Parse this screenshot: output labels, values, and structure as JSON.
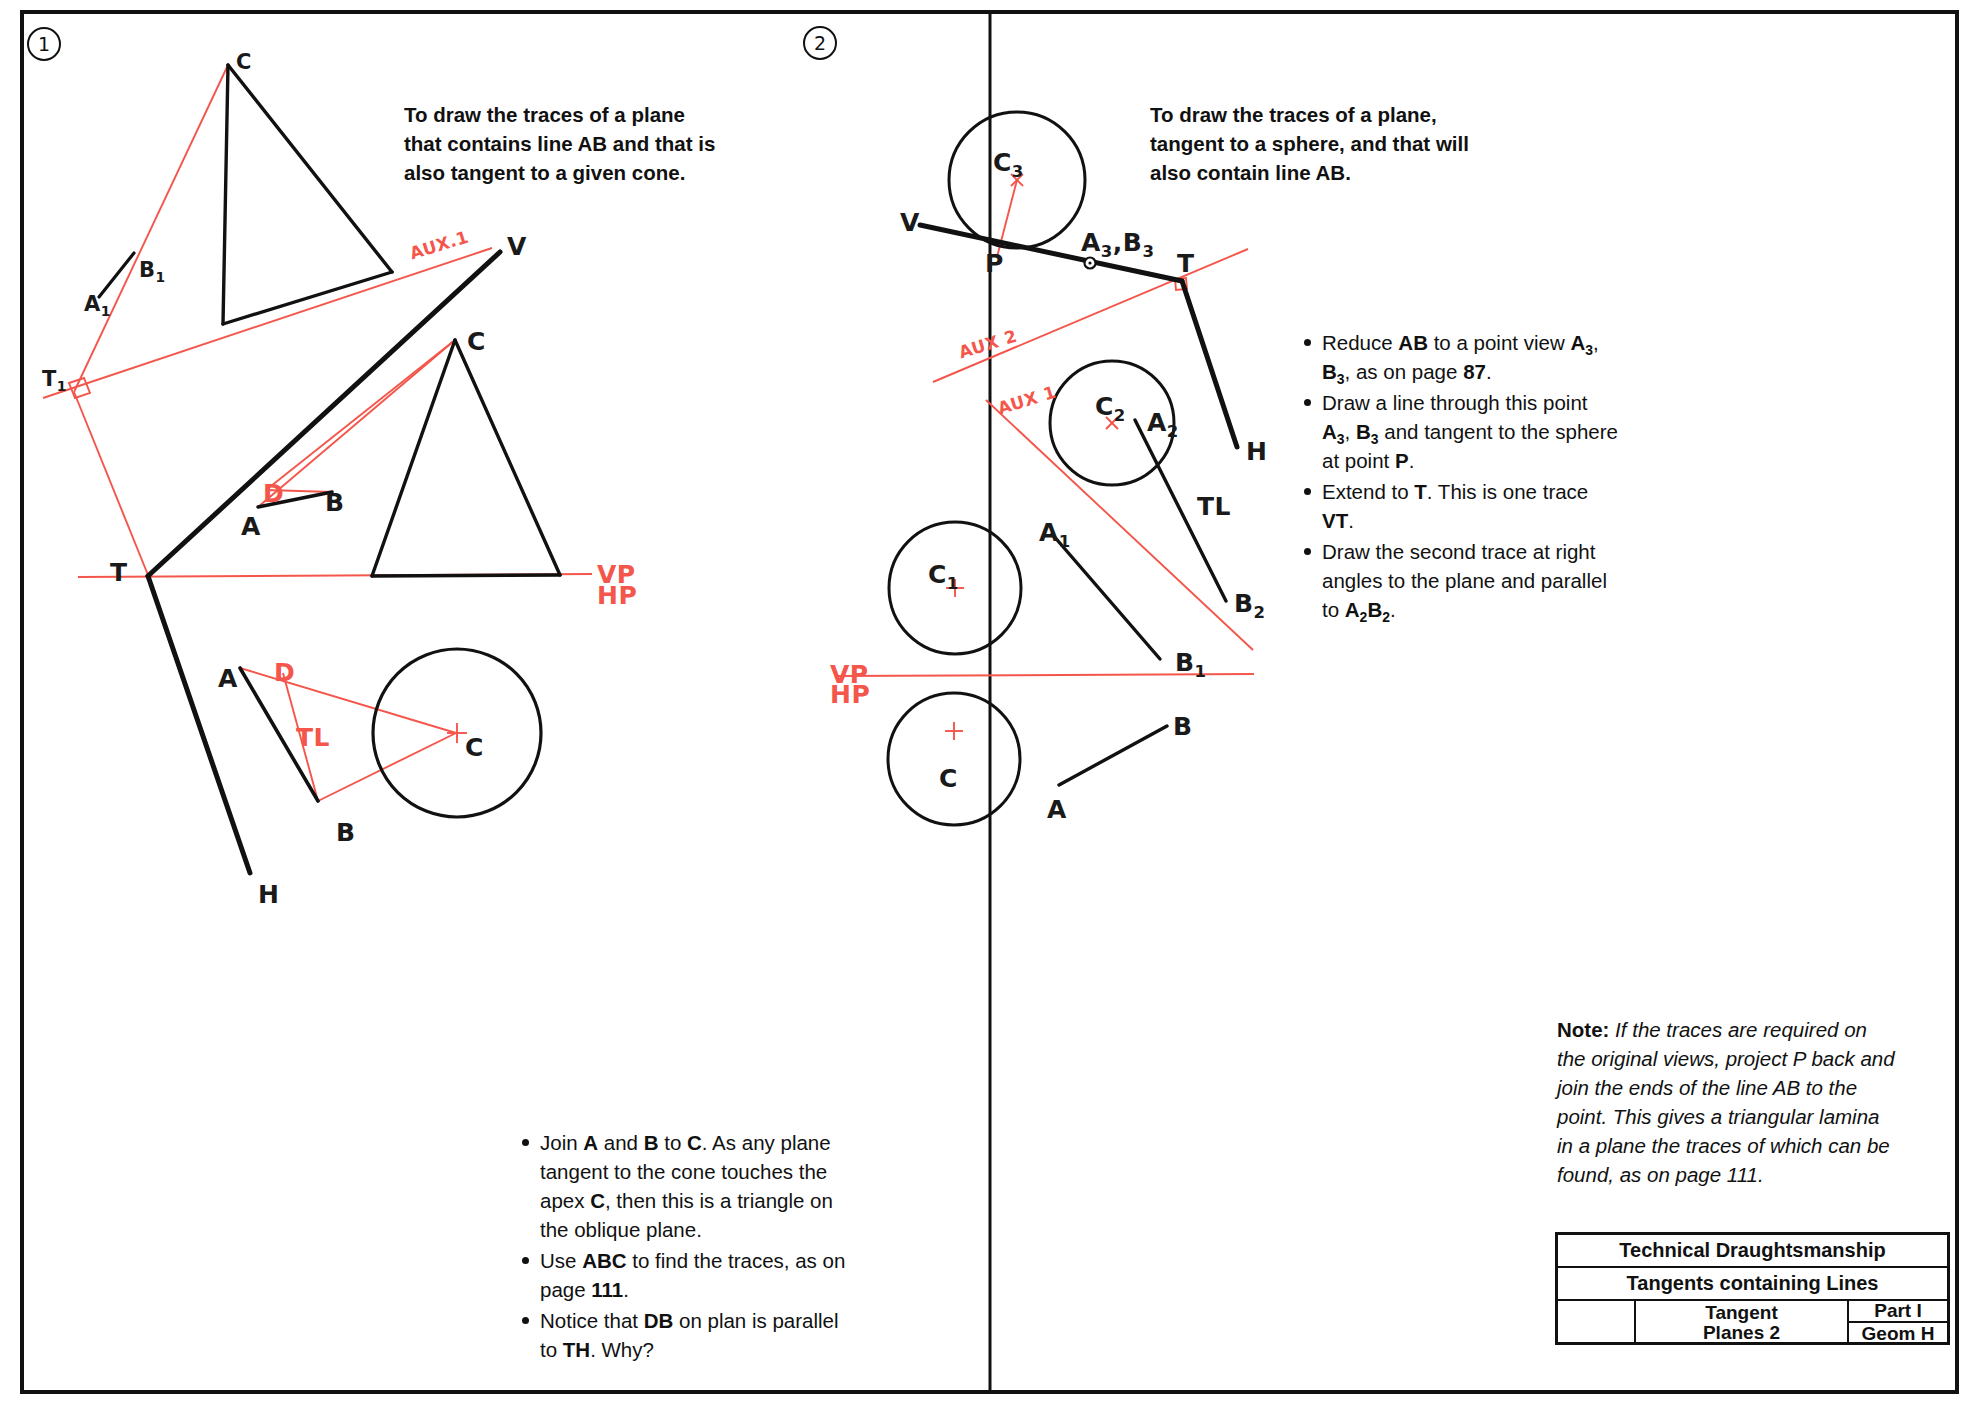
{
  "sheet": {
    "panels": [
      {
        "number": "1",
        "heading": "To draw the traces of a plane that contains line AB and that is also tangent to a given cone.",
        "bullets": [
          "Join <b>A</b> and <b>B</b> to <b>C</b>. As any plane tangent to the cone touches the apex <b>C</b>, then this is a triangle on the oblique plane.",
          "Use <b>ABC</b> to find the traces, as on page <b>111</b>.",
          "Notice that <b>DB</b> on plan is parallel to <b>TH</b>. Why?"
        ],
        "labels": [
          {
            "name": "apex-c-aux",
            "text": "C",
            "x": 236,
            "y": 50,
            "red": false,
            "size": "sm"
          },
          {
            "name": "point-b1",
            "text": "B<sub>1</sub>",
            "x": 139,
            "y": 258,
            "red": false,
            "size": "sm"
          },
          {
            "name": "point-a1",
            "text": "A<sub>1</sub>",
            "x": 84,
            "y": 292,
            "red": false,
            "size": "sm"
          },
          {
            "name": "trace-t1",
            "text": "T<sub>1</sub>",
            "x": 42,
            "y": 367,
            "red": false,
            "size": "sm"
          },
          {
            "name": "aux1-line-label",
            "text": "AUX.1",
            "x": 409,
            "y": 235,
            "red": true
          },
          {
            "name": "vertical-trace-v",
            "text": "V",
            "x": 507,
            "y": 232,
            "red": false
          },
          {
            "name": "apex-c-elevation",
            "text": "C",
            "x": 467,
            "y": 327,
            "red": false
          },
          {
            "name": "point-d-elevation",
            "text": "D",
            "x": 263,
            "y": 479,
            "red": true
          },
          {
            "name": "point-b-elevation",
            "text": "B",
            "x": 325,
            "y": 488,
            "red": false
          },
          {
            "name": "point-a-elevation",
            "text": "A",
            "x": 241,
            "y": 512,
            "red": false
          },
          {
            "name": "trace-t",
            "text": "T",
            "x": 110,
            "y": 558,
            "red": false
          },
          {
            "name": "vp-label",
            "text": "VP",
            "x": 597,
            "y": 560,
            "red": true
          },
          {
            "name": "hp-label",
            "text": "HP",
            "x": 597,
            "y": 581,
            "red": true
          },
          {
            "name": "point-a-plan",
            "text": "A",
            "x": 218,
            "y": 664,
            "red": false
          },
          {
            "name": "point-d-plan",
            "text": "D",
            "x": 274,
            "y": 658,
            "red": true
          },
          {
            "name": "tl-label-plan",
            "text": "TL",
            "x": 296,
            "y": 723,
            "red": true
          },
          {
            "name": "centre-c-plan",
            "text": "C",
            "x": 465,
            "y": 733,
            "red": false
          },
          {
            "name": "point-b-plan",
            "text": "B",
            "x": 336,
            "y": 818,
            "red": false
          },
          {
            "name": "horizontal-trace-h",
            "text": "H",
            "x": 258,
            "y": 880,
            "red": false
          }
        ]
      },
      {
        "number": "2",
        "heading": "To draw the traces of a plane, tangent to a sphere, and that will also contain line AB.",
        "bullets": [
          "Reduce <b>AB</b> to a point view <b>A<sub>3</sub></b>, <b>B<sub>3</sub></b>, as on page <b>87</b>.",
          "Draw a line through this point <b>A<sub>3</sub></b>, <b>B<sub>3</sub></b> and tangent to the sphere at point <b>P</b>.",
          "Extend to <b>T</b>. This is one trace <b>VT</b>.",
          "Draw the second trace at right angles to the plane and parallel to <b>A<sub>2</sub>B<sub>2</sub></b>."
        ],
        "note_lead": "Note:",
        "note_body": "If the traces are required on the original views, project P back and join the ends of the line AB to the point. This gives a triangular lamina in a plane the traces of which can be found, as on page 111.",
        "labels": [
          {
            "name": "sphere-centre-c3",
            "text": "C<sub>3</sub>",
            "x": 993,
            "y": 148,
            "red": false
          },
          {
            "name": "vertical-trace-v2",
            "text": "V",
            "x": 900,
            "y": 208,
            "red": false
          },
          {
            "name": "tangent-point-p",
            "text": "P",
            "x": 985,
            "y": 249,
            "red": false
          },
          {
            "name": "point-view-a3b3",
            "text": "A<sub>3</sub>,B<sub>3</sub>",
            "x": 1081,
            "y": 228,
            "red": false
          },
          {
            "name": "trace-t2",
            "text": "T",
            "x": 1177,
            "y": 249,
            "red": false
          },
          {
            "name": "aux2-line-label",
            "text": "AUX 2",
            "x": 958,
            "y": 334,
            "red": true
          },
          {
            "name": "aux1-line-label-2",
            "text": "AUX 1",
            "x": 997,
            "y": 390,
            "red": true
          },
          {
            "name": "sphere-centre-c2",
            "text": "C<sub>2</sub>",
            "x": 1095,
            "y": 392,
            "red": false
          },
          {
            "name": "point-a2",
            "text": "A<sub>2</sub>",
            "x": 1147,
            "y": 408,
            "red": false
          },
          {
            "name": "horizontal-trace-h2",
            "text": "H",
            "x": 1246,
            "y": 437,
            "red": false
          },
          {
            "name": "tl-label-2",
            "text": "TL",
            "x": 1197,
            "y": 492,
            "red": false
          },
          {
            "name": "point-a1-2",
            "text": "A<sub>1</sub>",
            "x": 1039,
            "y": 518,
            "red": false
          },
          {
            "name": "sphere-centre-c1",
            "text": "C<sub>1</sub>",
            "x": 928,
            "y": 560,
            "red": false
          },
          {
            "name": "point-b2",
            "text": "B<sub>2</sub>",
            "x": 1234,
            "y": 589,
            "red": false
          },
          {
            "name": "point-b1-2",
            "text": "B<sub>1</sub>",
            "x": 1175,
            "y": 648,
            "red": false
          },
          {
            "name": "vp-label-2",
            "text": "VP",
            "x": 830,
            "y": 660,
            "red": true
          },
          {
            "name": "hp-label-2",
            "text": "HP",
            "x": 830,
            "y": 680,
            "red": true
          },
          {
            "name": "point-b-plan-2",
            "text": "B",
            "x": 1173,
            "y": 712,
            "red": false
          },
          {
            "name": "sphere-centre-c-plan",
            "text": "C",
            "x": 939,
            "y": 764,
            "red": false
          },
          {
            "name": "point-a-plan-2",
            "text": "A",
            "x": 1047,
            "y": 795,
            "red": false
          }
        ]
      }
    ],
    "title_block": {
      "subject": "Technical Draughtsmanship",
      "topic": "Tangents containing Lines",
      "drawing_line1": "Tangent",
      "drawing_line2": "Planes 2",
      "part": "Part I",
      "code": "Geom H",
      "symbols": [
        "first-angle-projection-icon",
        "target-icon"
      ]
    },
    "colors": {
      "construction_red": "#f4564b",
      "ink_black": "#111111",
      "paper": "#ffffff"
    }
  }
}
